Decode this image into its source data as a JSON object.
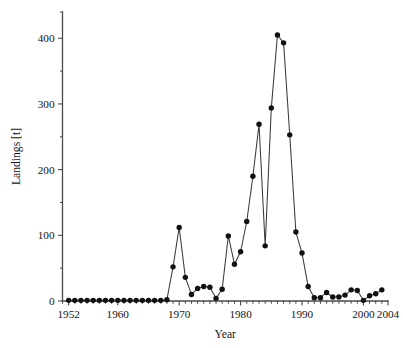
{
  "chart_data": {
    "type": "line",
    "title": "",
    "subtitle": "",
    "xlabel": "Year",
    "ylabel": "Landings [t]",
    "xlim": [
      1951,
      2004
    ],
    "ylim": [
      0,
      440
    ],
    "grid": false,
    "legend": null,
    "marker": "filled-circle",
    "line_color": "#3a3a3a",
    "marker_color": "#111111",
    "xticks": [
      1952,
      1960,
      1970,
      1980,
      1990,
      2000,
      2004
    ],
    "xtick_labels": [
      "1952",
      "1960",
      "1970",
      "1980",
      "1990",
      "2000",
      "2004"
    ],
    "xtick_minor_step": 1,
    "yticks": [
      0,
      100,
      200,
      300,
      400
    ],
    "ytick_labels": [
      "0",
      "100",
      "200",
      "300",
      "400"
    ],
    "ytick_minor": [
      50,
      150,
      250,
      350,
      440
    ],
    "series_name": "Landings",
    "x": [
      1952,
      1953,
      1954,
      1955,
      1956,
      1957,
      1958,
      1959,
      1960,
      1961,
      1962,
      1963,
      1964,
      1965,
      1966,
      1967,
      1968,
      1969,
      1970,
      1971,
      1972,
      1973,
      1974,
      1975,
      1976,
      1977,
      1978,
      1979,
      1980,
      1981,
      1982,
      1983,
      1984,
      1985,
      1986,
      1987,
      1988,
      1989,
      1990,
      1991,
      1992,
      1993,
      1994,
      1995,
      1996,
      1997,
      1998,
      1999,
      2000,
      2001,
      2002,
      2003
    ],
    "y": [
      1,
      1,
      1,
      1,
      1,
      1,
      1,
      1,
      1,
      1,
      1,
      1,
      1,
      1,
      1,
      1,
      2,
      52,
      112,
      36,
      10,
      19,
      22,
      21,
      4,
      18,
      99,
      56,
      75,
      121,
      190,
      269,
      84,
      294,
      405,
      393,
      253,
      105,
      73,
      22,
      5,
      5,
      13,
      6,
      6,
      9,
      17,
      16,
      1,
      8,
      11,
      17
    ]
  },
  "axis": {
    "x_title": "Year",
    "y_title": "Landings [t]"
  }
}
